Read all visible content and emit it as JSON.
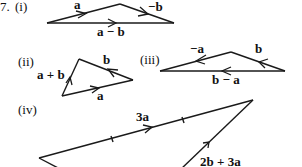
{
  "question_number": "7.",
  "parts": [
    {
      "id": "i",
      "label": "(i)",
      "vectors": [
        {
          "name": "a",
          "label": "a"
        },
        {
          "name": "neg-b",
          "label": "−b"
        },
        {
          "name": "a-minus-b",
          "label": "a − b"
        }
      ]
    },
    {
      "id": "ii",
      "label": "(ii)",
      "vectors": [
        {
          "name": "a-plus-b",
          "label": "a + b"
        },
        {
          "name": "b",
          "label": "b"
        },
        {
          "name": "a",
          "label": "a"
        }
      ]
    },
    {
      "id": "iii",
      "label": "(iii)",
      "vectors": [
        {
          "name": "neg-a",
          "label": "−a"
        },
        {
          "name": "b",
          "label": "b"
        },
        {
          "name": "b-minus-a",
          "label": "b − a"
        }
      ]
    },
    {
      "id": "iv",
      "label": "(iv)",
      "vectors": [
        {
          "name": "3a",
          "label": "3a"
        },
        {
          "name": "2b-plus-3a",
          "label": "2b + 3a"
        }
      ]
    }
  ],
  "colors": {
    "stroke": "#1a1a1a",
    "text": "#111111",
    "background": "#ffffff"
  }
}
